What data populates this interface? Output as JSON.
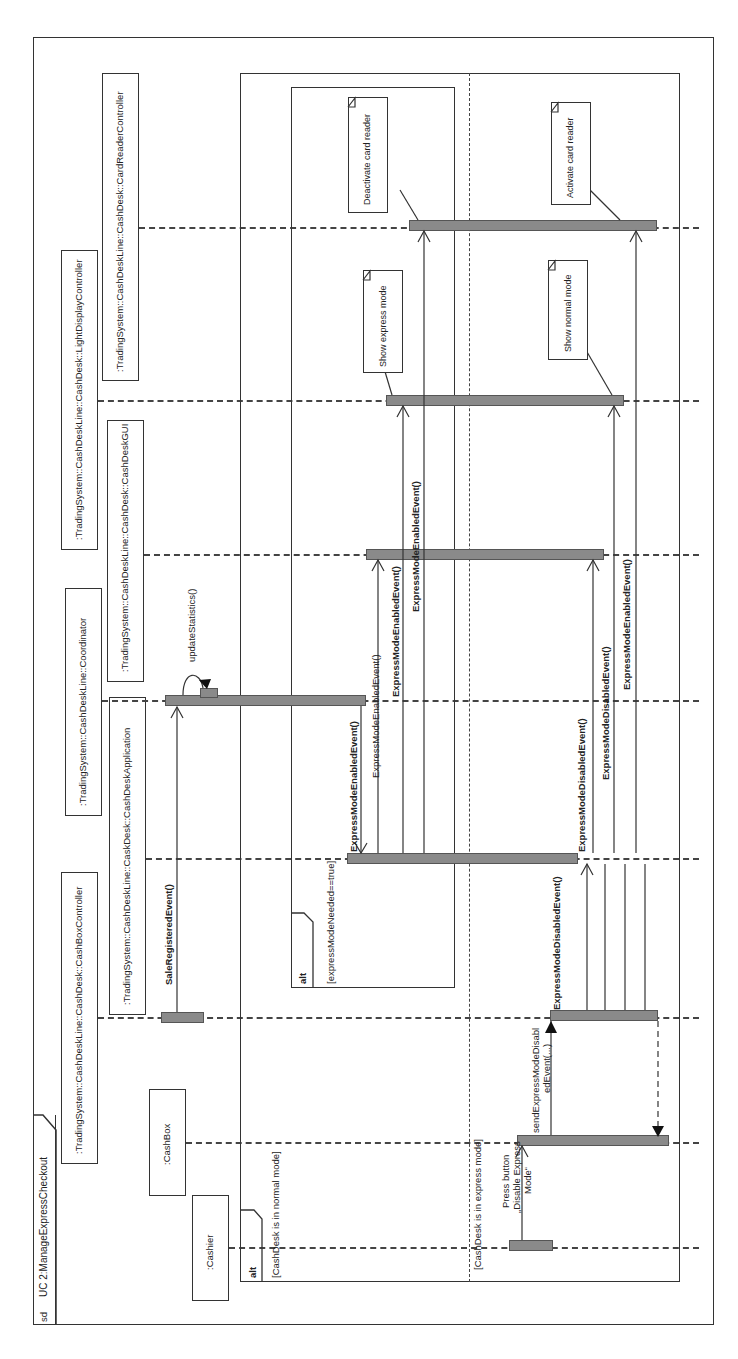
{
  "diagram": {
    "kind": "UML sequence diagram",
    "orientation": "rotated 90deg counter-clockwise",
    "frame_tag": "sd",
    "frame_title": "UC 2:ManageExpressCheckout"
  },
  "lifelines": [
    {
      "id": "cashier",
      "label": ":Cashier"
    },
    {
      "id": "cashbox",
      "label": ":CashBox"
    },
    {
      "id": "cashboxcontroller",
      "label": ":TradingSystem::CashDeskLine::CashDesk::CashBoxController"
    },
    {
      "id": "cashdeskapp",
      "label": ":TradingSystem::CashDeskLine::CaskDesk::CashDeskApplication"
    },
    {
      "id": "coordinator",
      "label": ":TradingSystem::CashDeskLine::Coordinator"
    },
    {
      "id": "gui",
      "label": ":TradingSystem::CashDeskLine::CashDesk::CashDeskGUI"
    },
    {
      "id": "light",
      "label": ":TradingSystem::CashDeskLine::CashDesk::LightDisplayController"
    },
    {
      "id": "cardreader",
      "label": ":TradingSystem::CashDeskLine::CashDesk::CardReaderController"
    }
  ],
  "messages": {
    "sale_registered": "SaleRegisteredEvent()",
    "update_statistics": "updateStatistics()",
    "enabled_coord_to_app": "ExpressModeEnabledEvent()",
    "enabled_app_to_gui": "ExpressModeEnabledEvent()",
    "enabled_app_to_light": "ExpressModeEnabledEvent()",
    "enabled_app_to_card": "ExpressModeEnabledEvent()",
    "press_button": "Press button „Disable Express Mode“",
    "press_button_l1": "Press button",
    "press_button_l2": "„Disable Express",
    "press_button_l3": "Mode“",
    "send_disabled_l1": "sendExpressModeDisabl",
    "send_disabled_l2": "edEvent(...)",
    "disabled_ctrl_to_app": "ExpressModeDisabledEvent()",
    "disabled_app_to_gui": "ExpressModeDisabledEvent()",
    "disabled_app_to_light": "ExpressModeDisabledEvent()",
    "enabled_app_to_card_2": "ExpressModeEnabledEvent()"
  },
  "fragments": {
    "outer_alt": {
      "operator": "alt",
      "guard_1": "[CashDesk is in normal mode]",
      "guard_2": "[CashDesk is in express mode]"
    },
    "inner_alt": {
      "operator": "alt",
      "guard": "[expressModeNeeded==true]"
    }
  },
  "notes": {
    "deactivate_card": "Deactivate card reader",
    "show_express": "Show express mode",
    "activate_card": "Activate card reader",
    "show_normal": "Show normal mode"
  },
  "colors": {
    "line": "#333333",
    "activation_bar": "#8a8a8a",
    "background": "#ffffff"
  }
}
